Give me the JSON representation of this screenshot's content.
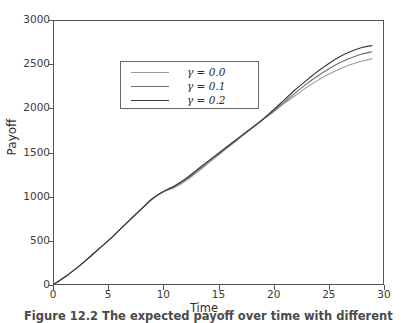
{
  "figure": {
    "caption": "Figure 12.2  The expected payoff over time with different",
    "background": "#ffffff"
  },
  "chart_data": {
    "type": "line",
    "title": "",
    "xlabel": "Time",
    "ylabel": "Payoff",
    "xlim": [
      0,
      30
    ],
    "ylim": [
      0,
      3000
    ],
    "xticks": [
      0,
      5,
      10,
      15,
      20,
      25,
      30
    ],
    "yticks": [
      0,
      500,
      1000,
      1500,
      2000,
      2500,
      3000
    ],
    "xtick_labels": [
      "0",
      "5",
      "10",
      "15",
      "20",
      "25",
      "30"
    ],
    "ytick_labels": [
      "0",
      "500",
      "1000",
      "1500",
      "2000",
      "2500",
      "3000"
    ],
    "grid": false,
    "legend_position": "upper left",
    "x": [
      0,
      1,
      2,
      3,
      4,
      5,
      6,
      7,
      8,
      9,
      10,
      11,
      12,
      13,
      14,
      15,
      16,
      17,
      18,
      19,
      20,
      21,
      22,
      23,
      24,
      25,
      26,
      27,
      28,
      29
    ],
    "series": [
      {
        "name": "gamma = 0.0",
        "label": "γ = 0.0",
        "gamma": "0.0",
        "color": "#9a9a9a",
        "linewidth": 1.1,
        "values": [
          0,
          80,
          175,
          280,
          390,
          500,
          620,
          740,
          860,
          975,
          1055,
          1100,
          1175,
          1270,
          1370,
          1470,
          1570,
          1670,
          1770,
          1870,
          1960,
          2060,
          2150,
          2240,
          2320,
          2390,
          2450,
          2500,
          2540,
          2570
        ]
      },
      {
        "name": "gamma = 0.1",
        "label": "γ = 0.1",
        "gamma": "0.1",
        "color": "#6d6d6d",
        "linewidth": 1.1,
        "values": [
          0,
          80,
          175,
          280,
          390,
          500,
          620,
          740,
          860,
          975,
          1055,
          1110,
          1190,
          1285,
          1385,
          1482,
          1580,
          1678,
          1775,
          1872,
          1970,
          2075,
          2180,
          2280,
          2370,
          2450,
          2520,
          2575,
          2620,
          2650
        ]
      },
      {
        "name": "gamma = 0.2",
        "label": "γ = 0.2",
        "gamma": "0.2",
        "color": "#3c3c3c",
        "linewidth": 1.2,
        "values": [
          0,
          80,
          175,
          280,
          390,
          500,
          620,
          740,
          860,
          975,
          1055,
          1120,
          1200,
          1298,
          1396,
          1492,
          1588,
          1684,
          1778,
          1874,
          1985,
          2100,
          2215,
          2320,
          2420,
          2510,
          2590,
          2650,
          2695,
          2720
        ]
      }
    ]
  },
  "axes": {
    "frame_color": "#555555",
    "tick_color": "#555555"
  }
}
